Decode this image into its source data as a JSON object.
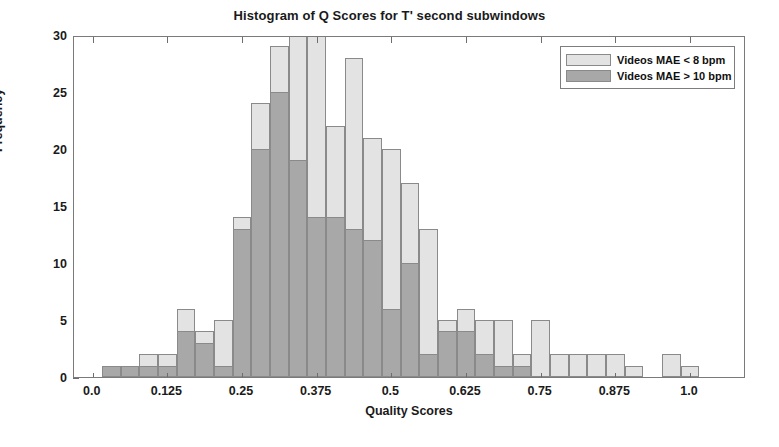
{
  "chart_data": {
    "type": "bar",
    "title": "Histogram of Q Scores for T' second subwindows",
    "xlabel": "Quality Scores",
    "ylabel": "Frequency",
    "xlim": [
      -0.0313,
      1.0938
    ],
    "ylim": [
      0,
      30
    ],
    "grid": false,
    "bin_width": 0.03125,
    "overlay": "overlapping-histogram",
    "legend_position": "top-right",
    "colors": {
      "series_light": "#e3e3e3",
      "series_dark": "#a8a8a8",
      "axis": "#7a7a7a",
      "text": "#1a1a1a"
    },
    "xticks": [
      0.0,
      0.125,
      0.25,
      0.375,
      0.5,
      0.625,
      0.75,
      0.875,
      1.0
    ],
    "xtick_labels": [
      "0.0",
      "0.125",
      "0.25",
      "0.375",
      "0.5",
      "0.625",
      "0.75",
      "0.875",
      "1.0"
    ],
    "yticks": [
      0,
      5,
      10,
      15,
      20,
      25,
      30
    ],
    "ytick_labels": [
      "0",
      "5",
      "10",
      "15",
      "20",
      "25",
      "30"
    ],
    "bin_centers": [
      0.0,
      0.03125,
      0.0625,
      0.09375,
      0.125,
      0.15625,
      0.1875,
      0.21875,
      0.25,
      0.28125,
      0.3125,
      0.34375,
      0.375,
      0.40625,
      0.4375,
      0.46875,
      0.5,
      0.53125,
      0.5625,
      0.59375,
      0.625,
      0.65625,
      0.6875,
      0.71875,
      0.75,
      0.78125,
      0.8125,
      0.84375,
      0.875,
      0.90625,
      0.9375,
      0.96875,
      1.0,
      1.03125
    ],
    "series": [
      {
        "name": "Videos MAE < 8 bpm",
        "color": "#e3e3e3",
        "values": [
          0,
          1,
          1,
          2,
          2,
          6,
          4,
          5,
          14,
          24,
          29,
          30,
          30,
          22,
          28,
          21,
          20,
          17,
          13,
          5,
          6,
          5,
          5,
          2,
          5,
          2,
          2,
          2,
          2,
          1,
          0,
          2,
          1,
          0
        ]
      },
      {
        "name": "Videos MAE > 10 bpm",
        "color": "#a8a8a8",
        "values": [
          0,
          1,
          1,
          1,
          1,
          4,
          3,
          1,
          13,
          20,
          25,
          19,
          14,
          14,
          13,
          12,
          6,
          10,
          2,
          4,
          4,
          2,
          1,
          1,
          0,
          0,
          0,
          0,
          0,
          0,
          0,
          0,
          0,
          0
        ]
      }
    ]
  },
  "legend": {
    "entries": [
      {
        "label": "Videos MAE < 8 bpm",
        "style": "light"
      },
      {
        "label": "Videos MAE > 10 bpm",
        "style": "dark"
      }
    ]
  }
}
